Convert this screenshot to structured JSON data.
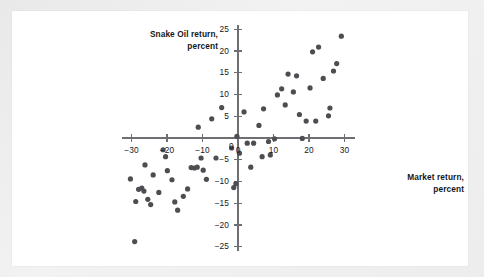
{
  "chart_data": {
    "type": "scatter",
    "title": "",
    "xlabel": "Market return, percent",
    "ylabel": "Snake Oil return, percent",
    "xlim": [
      -32,
      31
    ],
    "ylim": [
      -26,
      26
    ],
    "xticks": [
      -30,
      -20,
      -10,
      0,
      10,
      20,
      30
    ],
    "xtick_labels": [
      "−30",
      "−20",
      "−10",
      "0",
      "10",
      "20",
      "30"
    ],
    "yticks": [
      -25,
      -20,
      -15,
      -10,
      -5,
      0,
      5,
      10,
      15,
      20,
      25
    ],
    "ytick_labels": [
      "−25",
      "−20",
      "−15",
      "−10",
      "−5",
      "0",
      "5",
      "10",
      "15",
      "20",
      "25"
    ],
    "grid": false,
    "legend": null,
    "marker": {
      "shape": "circle",
      "radius_px": 2.6,
      "color": "#4d4d52"
    },
    "axis_color": "#6e6e73",
    "points": [
      {
        "x": -30.3,
        "y": -9.4
      },
      {
        "x": -29.1,
        "y": -23.8
      },
      {
        "x": -28.8,
        "y": -14.6
      },
      {
        "x": -28.0,
        "y": -11.8
      },
      {
        "x": -27.1,
        "y": -11.5
      },
      {
        "x": -26.5,
        "y": -12.2
      },
      {
        "x": -26.2,
        "y": -6.2
      },
      {
        "x": -25.4,
        "y": -14.1
      },
      {
        "x": -24.6,
        "y": -15.3
      },
      {
        "x": -23.9,
        "y": -8.5
      },
      {
        "x": -22.3,
        "y": -12.5
      },
      {
        "x": -21.1,
        "y": -2.7
      },
      {
        "x": -20.4,
        "y": -4.3
      },
      {
        "x": -19.9,
        "y": -7.5
      },
      {
        "x": -18.6,
        "y": -9.6
      },
      {
        "x": -17.8,
        "y": -14.7
      },
      {
        "x": -17.0,
        "y": -16.6
      },
      {
        "x": -15.4,
        "y": -13.4
      },
      {
        "x": -14.2,
        "y": -11.7
      },
      {
        "x": -13.2,
        "y": -6.8
      },
      {
        "x": -12.3,
        "y": -6.9
      },
      {
        "x": -11.5,
        "y": -6.7
      },
      {
        "x": -11.2,
        "y": 2.5
      },
      {
        "x": -10.4,
        "y": -4.6
      },
      {
        "x": -9.8,
        "y": -7.4
      },
      {
        "x": -8.9,
        "y": -9.5
      },
      {
        "x": -7.4,
        "y": 4.4
      },
      {
        "x": -6.2,
        "y": -4.6
      },
      {
        "x": -4.6,
        "y": 7.0
      },
      {
        "x": -1.8,
        "y": -2.3
      },
      {
        "x": -1.2,
        "y": -11.4
      },
      {
        "x": -0.6,
        "y": -10.5
      },
      {
        "x": -0.3,
        "y": 0.4
      },
      {
        "x": 0.4,
        "y": -3.5
      },
      {
        "x": 1.7,
        "y": 6.0
      },
      {
        "x": 2.6,
        "y": -1.2
      },
      {
        "x": 3.6,
        "y": -6.7
      },
      {
        "x": 4.4,
        "y": -1.2
      },
      {
        "x": 5.9,
        "y": 2.9
      },
      {
        "x": 6.8,
        "y": -4.3
      },
      {
        "x": 7.2,
        "y": 6.7
      },
      {
        "x": 8.6,
        "y": -0.8
      },
      {
        "x": 9.1,
        "y": -3.9
      },
      {
        "x": 10.3,
        "y": -0.2
      },
      {
        "x": 11.1,
        "y": 9.9
      },
      {
        "x": 12.3,
        "y": 11.3
      },
      {
        "x": 13.3,
        "y": 7.6
      },
      {
        "x": 14.1,
        "y": 14.7
      },
      {
        "x": 15.6,
        "y": 10.6
      },
      {
        "x": 16.5,
        "y": 14.3
      },
      {
        "x": 17.3,
        "y": 5.4
      },
      {
        "x": 18.1,
        "y": -0.1
      },
      {
        "x": 19.2,
        "y": 3.9
      },
      {
        "x": 20.3,
        "y": 11.5
      },
      {
        "x": 21.0,
        "y": 19.8
      },
      {
        "x": 21.9,
        "y": 3.9
      },
      {
        "x": 22.7,
        "y": 20.9
      },
      {
        "x": 24.0,
        "y": 13.7
      },
      {
        "x": 25.5,
        "y": 5.1
      },
      {
        "x": 25.9,
        "y": 6.9
      },
      {
        "x": 26.9,
        "y": 15.4
      },
      {
        "x": 27.8,
        "y": 17.1
      },
      {
        "x": 29.1,
        "y": 23.4
      }
    ]
  }
}
